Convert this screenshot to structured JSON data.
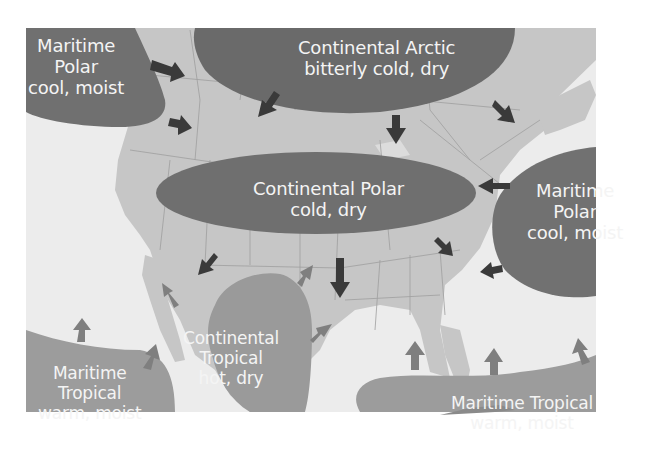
{
  "figure": {
    "colors": {
      "background": "#ffffff",
      "ocean": "#ececec",
      "land": "#c6c6c6",
      "polar_mass": "#6f6f6f",
      "arctic_mass": "#6a6a6a",
      "tropical_mass": "#9a9a9a",
      "dark_arrow": "#3a3a3a",
      "light_arrow": "#808080",
      "label_text": "#f4f4f4"
    }
  },
  "air_masses": [
    {
      "id": "mp-pacific",
      "lines": [
        "Maritime",
        "Polar",
        "cool, moist"
      ]
    },
    {
      "id": "ca",
      "lines": [
        "Continental Arctic",
        "bitterly cold, dry"
      ]
    },
    {
      "id": "cp",
      "lines": [
        "Continental Polar",
        "cold, dry"
      ]
    },
    {
      "id": "mp-atlantic",
      "lines": [
        "Maritime",
        "Polar",
        "cool, moist"
      ]
    },
    {
      "id": "mt-pacific",
      "lines": [
        "Maritime",
        "Tropical",
        "warm, moist"
      ]
    },
    {
      "id": "ct",
      "lines": [
        "Continental",
        "Tropical",
        "hot, dry"
      ]
    },
    {
      "id": "mt-gulf",
      "lines": [
        "Maritime Tropical",
        "warm, moist"
      ]
    }
  ]
}
